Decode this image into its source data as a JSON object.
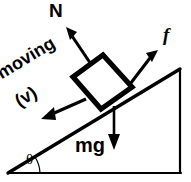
{
  "figure": {
    "width": 191,
    "height": 182,
    "background_color": "#ffffff",
    "stroke_color": "#000000"
  },
  "labels": {
    "normal_force": "N",
    "friction_force": "f",
    "weight": "mg",
    "motion": "moving",
    "velocity": "(v)",
    "incline_angle": "θ"
  },
  "geometry": {
    "incline": {
      "apex": [
        8,
        173
      ],
      "top_right": [
        180,
        69
      ],
      "bottom_right": [
        180,
        173
      ],
      "angle_degrees": 31
    },
    "block": {
      "center": [
        102,
        81
      ],
      "side": 42,
      "rotation_degrees": -31
    },
    "vectors": [
      {
        "name": "normal-force-vector",
        "label": "N",
        "from": [
          102,
          81
        ],
        "to": [
          67,
          29
        ],
        "direction": "perpendicular-to-incline-outward"
      },
      {
        "name": "friction-force-vector",
        "label": "f",
        "from": [
          125,
          91
        ],
        "to": [
          157,
          52
        ],
        "direction": "up-the-incline"
      },
      {
        "name": "velocity-vector",
        "label": "(v)",
        "from": [
          84,
          100
        ],
        "to": [
          43,
          118
        ],
        "direction": "down-the-incline"
      },
      {
        "name": "weight-vector",
        "label": "mg",
        "from": [
          114,
          108
        ],
        "to": [
          114,
          148
        ],
        "direction": "vertically-downward"
      }
    ]
  }
}
